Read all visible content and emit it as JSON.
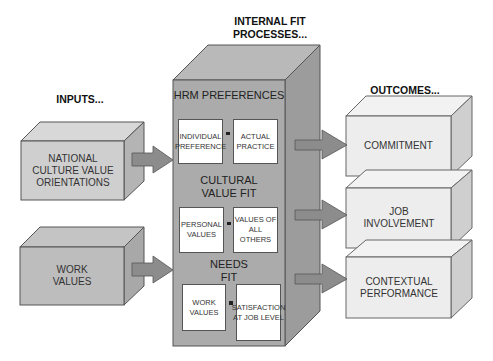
{
  "headers": {
    "inputs": "INPUTS...",
    "internal": "INTERNAL FIT PROCESSES...",
    "outcomes": "OUTCOMES..."
  },
  "inputs": [
    {
      "label": "NATIONAL CULTURE VALUE ORIENTATIONS"
    },
    {
      "label": "WORK VALUES"
    }
  ],
  "internal_fit": {
    "sections": [
      {
        "title": "HRM PREFERENCES",
        "left": "INDIVIDUAL PREFERENCE",
        "operator": "-",
        "right": "ACTUAL PRACTICE"
      },
      {
        "title": "CULTURAL VALUE FIT",
        "left": "PERSONAL VALUES",
        "operator": "-",
        "right": "VALUES OF ALL OTHERS"
      },
      {
        "title": "NEEDS FIT",
        "left": "WORK VALUES",
        "operator": "-",
        "right": "SATISFACTION AT JOB LEVEL"
      }
    ]
  },
  "outcomes": [
    {
      "label": "COMMITMENT"
    },
    {
      "label": "JOB INVOLVEMENT"
    },
    {
      "label": "CONTEXTUAL PERFORMANCE"
    }
  ],
  "colors": {
    "central_front": "#a9a9a9",
    "central_top": "#b8b8b8",
    "central_side": "#9a9a9a",
    "input_front": "#c8c8c8",
    "outcome_front": "#ececec",
    "arrow": "#8a8a8a"
  }
}
